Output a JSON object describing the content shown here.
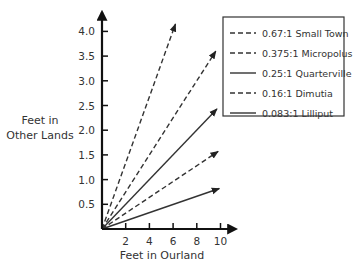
{
  "chart_data": {
    "type": "line",
    "title": "",
    "xlabel": "Feet in Ourland",
    "ylabel_lines": [
      "Feet in",
      "Other Lands"
    ],
    "xlim": [
      0,
      10.5
    ],
    "ylim": [
      0,
      4.2
    ],
    "xticks": [
      2,
      4,
      6,
      8,
      10
    ],
    "xtick_labels": [
      "2",
      "4",
      "6",
      "8",
      "10"
    ],
    "yticks": [
      0.5,
      1.0,
      1.5,
      2.0,
      2.5,
      3.0,
      3.5,
      4.0
    ],
    "ytick_labels": [
      "0.5",
      "1.0",
      "1.5",
      "2.0",
      "2.5",
      "3.0",
      "3.5",
      "4.0"
    ],
    "grid": false,
    "legend_position": "upper right",
    "series": [
      {
        "name": "0.67:1 Small Town",
        "slope": 0.67,
        "style": "dashed",
        "x": [
          0,
          6.2
        ],
        "y": [
          0,
          4.15
        ]
      },
      {
        "name": "0.375:1 Micropolus",
        "slope": 0.375,
        "style": "dashed",
        "x": [
          0,
          9.6
        ],
        "y": [
          0,
          3.6
        ]
      },
      {
        "name": "0.25:1 Quarterville",
        "slope": 0.25,
        "style": "solid",
        "x": [
          0,
          9.7
        ],
        "y": [
          0,
          2.43
        ]
      },
      {
        "name": "0.16:1 Dimutia",
        "slope": 0.16,
        "style": "dashed",
        "x": [
          0,
          9.8
        ],
        "y": [
          0,
          1.57
        ]
      },
      {
        "name": "0.083:1 Lilliput",
        "slope": 0.083,
        "style": "solid",
        "x": [
          0,
          9.9
        ],
        "y": [
          0,
          0.82
        ]
      }
    ]
  },
  "colors": {
    "line": "#333333",
    "axis": "#111111",
    "text": "#333333",
    "background": "#ffffff"
  }
}
